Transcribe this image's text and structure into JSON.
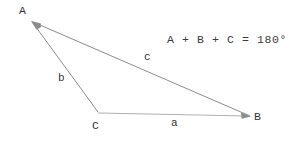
{
  "figure": {
    "type": "geometry-diagram",
    "canvas": {
      "width": 305,
      "height": 141
    },
    "background_color": "#ffffff",
    "line_color": "#8c8c8c",
    "text_color": "#333333"
  },
  "vertices": [
    {
      "name": "A",
      "label": "A",
      "x": 31,
      "y": 21,
      "label_x": 19,
      "label_y": 5
    },
    {
      "name": "B",
      "label": "B",
      "x": 250,
      "y": 116,
      "label_x": 254,
      "label_y": 111
    },
    {
      "name": "C",
      "label": "C",
      "x": 98,
      "y": 112,
      "label_x": 92,
      "label_y": 120
    }
  ],
  "sides": [
    {
      "name": "a",
      "label": "a",
      "from": "C",
      "to": "B",
      "label_x": 171,
      "label_y": 118
    },
    {
      "name": "b",
      "label": "b",
      "from": "A",
      "to": "C",
      "label_x": 58,
      "label_y": 73
    },
    {
      "name": "c",
      "label": "c",
      "from": "A",
      "to": "B",
      "label_x": 144,
      "label_y": 52
    }
  ],
  "arrows": [
    {
      "name": "arrow-to-a-from-c",
      "tip_at": "A"
    },
    {
      "name": "arrow-to-a-from-b",
      "tip_at": "A"
    },
    {
      "name": "arrow-to-b",
      "tip_at": "B"
    }
  ],
  "annotation": {
    "equation": "A + B + C = 180°",
    "x": 167,
    "y": 33
  }
}
